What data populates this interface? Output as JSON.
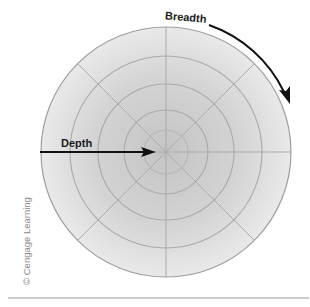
{
  "diagram": {
    "labels": {
      "depth": "Depth",
      "breadth": "Breadth"
    },
    "copyright": "© Cengage Learning",
    "circle": {
      "center": [
        166,
        152
      ],
      "outer_radius": 125,
      "ring_radii": [
        96,
        68,
        42,
        22
      ],
      "spoke_angles_deg": [
        0,
        45,
        90,
        135
      ],
      "colors": {
        "center_fill": "#c4c4c4",
        "edge_fill": "#e8e8e8",
        "ring_line": "#a9a9a9",
        "outer_border": "#9e9e9e"
      }
    },
    "arrows": {
      "depth": {
        "from": [
          40,
          152
        ],
        "to": [
          156,
          152
        ],
        "color": "#111111"
      },
      "breadth": {
        "arc_start": [
          210,
          24
        ],
        "arc_end": [
          289,
          103
        ],
        "color": "#111111"
      }
    },
    "footer_rule": {
      "color": "#9a9a9a"
    }
  }
}
